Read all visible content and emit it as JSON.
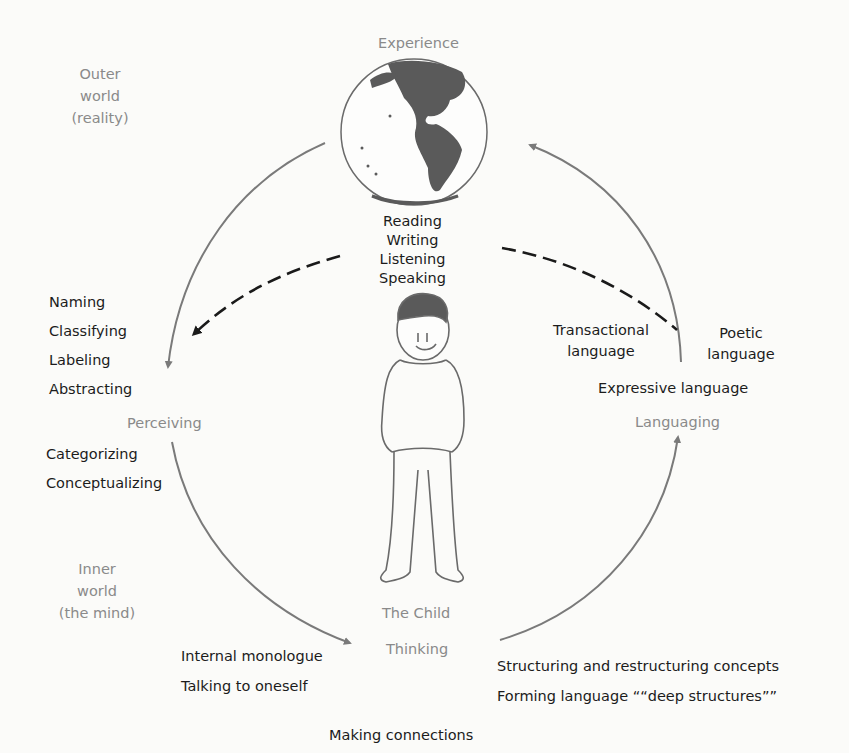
{
  "diagram": {
    "regions": {
      "outer_world": [
        "Outer",
        "world",
        "(reality)"
      ],
      "inner_world": [
        "Inner",
        "world",
        "(the mind)"
      ]
    },
    "nodes": {
      "experience": "Experience",
      "perceiving": "Perceiving",
      "thinking": "Thinking",
      "languaging": "Languaging",
      "the_child": "The Child"
    },
    "center_activities": [
      "Reading",
      "Writing",
      "Listening",
      "Speaking"
    ],
    "perceiving_upper": [
      "Naming",
      "Classifying",
      "Labeling",
      "Abstracting"
    ],
    "perceiving_lower": [
      "Categorizing",
      "Conceptualizing"
    ],
    "thinking_left": [
      "Internal monologue",
      "Talking to oneself"
    ],
    "thinking_right": [
      "Structuring and restructuring concepts",
      "Forming language ““deep structures””"
    ],
    "thinking_bottom": "Making connections",
    "language_types": {
      "transactional": [
        "Transactional",
        "language"
      ],
      "poetic": [
        "Poetic",
        "language"
      ],
      "expressive": "Expressive language"
    },
    "colors": {
      "arc": "#7a7a7a",
      "dashed": "#1a1a1a",
      "gray_label": "#8a8a8a",
      "land": "#5a5a5a"
    }
  }
}
